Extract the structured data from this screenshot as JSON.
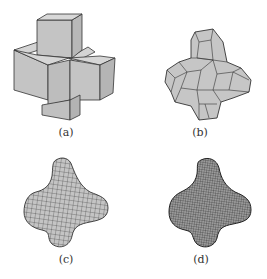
{
  "figure": {
    "panels": [
      {
        "id": "a",
        "label": "(a)",
        "description": "control mesh of cubes forming a 3D cross"
      },
      {
        "id": "b",
        "label": "(b)",
        "description": "coarse subdivided polygonal mesh"
      },
      {
        "id": "c",
        "label": "(c)",
        "description": "finer subdivided smooth surface"
      },
      {
        "id": "d",
        "label": "(d)",
        "description": "densely subdivided smooth surface"
      }
    ]
  },
  "colors": {
    "fill": "#c8c8c8",
    "stroke": "#333333",
    "background": "#ffffff"
  }
}
